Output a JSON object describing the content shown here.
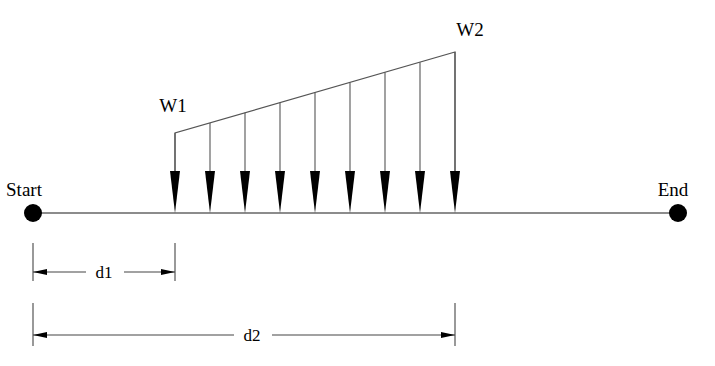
{
  "figure": {
    "type": "structural-load-diagram",
    "background_color": "#ffffff",
    "stroke_color": "#000000",
    "line_color": "#555555"
  },
  "labels": {
    "start": "Start",
    "end": "End",
    "load_left": "W1",
    "load_right": "W2",
    "dim_short": "d1",
    "dim_long": "d2"
  },
  "geometry": {
    "beam": {
      "y": 213,
      "x_start": 33,
      "x_end": 678,
      "node_radius": 9
    },
    "load": {
      "x_left": 175,
      "x_right": 455,
      "top_y_left": 133,
      "top_y_right": 52,
      "arrow_count": 9,
      "arrow_half_width": 5,
      "arrow_height": 42
    },
    "dim_d1": {
      "x_from": 33,
      "x_to": 175,
      "line_y": 272,
      "ext_top": 243,
      "ext_bottom": 281
    },
    "dim_d2": {
      "x_from": 33,
      "x_to": 455,
      "line_y": 335,
      "ext_top": 303,
      "ext_bottom": 346
    }
  },
  "chart_data": {
    "type": "area",
    "title": "",
    "xlabel": "",
    "ylabel": "",
    "categories": [
      "Start",
      "d1",
      "d2",
      "End"
    ],
    "series": [
      {
        "name": "Distributed load intensity",
        "x": [
          33,
          175,
          455,
          678
        ],
        "values": [
          0,
          80,
          161,
          0
        ]
      }
    ],
    "annotations": [
      {
        "text": "W1",
        "x": 175,
        "y": 133,
        "meaning": "load intensity at start of loaded region"
      },
      {
        "text": "W2",
        "x": 455,
        "y": 52,
        "meaning": "load intensity at end of loaded region"
      },
      {
        "text": "d1",
        "x": 104,
        "y": 272,
        "meaning": "distance from Start to beginning of load"
      },
      {
        "text": "d2",
        "x": 252,
        "y": 335,
        "meaning": "distance from Start to end of load"
      },
      {
        "text": "Start",
        "x": 33,
        "y": 213,
        "meaning": "left beam node"
      },
      {
        "text": "End",
        "x": 678,
        "y": 213,
        "meaning": "right beam node"
      }
    ],
    "grid": false,
    "legend": "none"
  }
}
